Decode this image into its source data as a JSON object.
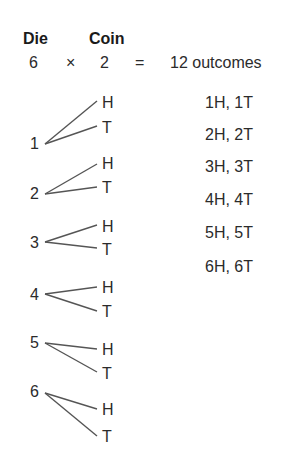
{
  "header": {
    "die_label": "Die",
    "coin_label": "Coin",
    "die_count": "6",
    "times": "×",
    "coin_count": "2",
    "equals": "=",
    "result": "12 outcomes"
  },
  "tree": {
    "die_faces": [
      "1",
      "2",
      "3",
      "4",
      "5",
      "6"
    ],
    "coin_faces": [
      "H",
      "T"
    ],
    "line_color": "#555555"
  },
  "outcomes": [
    "1H, 1T",
    "2H, 2T",
    "3H, 3T",
    "4H, 4T",
    "5H, 5T",
    "6H, 6T"
  ]
}
